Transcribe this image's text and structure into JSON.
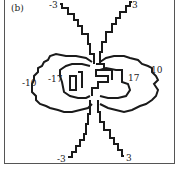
{
  "panel_label": "(b)",
  "contour_labels": {
    "top_left": "-3",
    "top_right": "3",
    "mid_left_outer": "-10",
    "mid_left_inner": "-17",
    "mid_right_inner": "17",
    "mid_right_outer": "10",
    "bottom_left": "-3",
    "bottom_right": "3"
  },
  "colors": {
    "line": "#1a1a1a",
    "frame": "#555555",
    "background": "#ffffff"
  }
}
